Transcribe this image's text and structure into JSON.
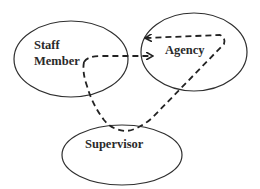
{
  "diagram": {
    "nodes": [
      {
        "id": "staff-member",
        "lines": [
          "Staff",
          "Member"
        ]
      },
      {
        "id": "agency",
        "lines": [
          "Agency"
        ]
      },
      {
        "id": "supervisor",
        "lines": [
          "Supervisor"
        ]
      }
    ],
    "edges": [
      {
        "from": "staff-member",
        "to": "agency",
        "style": "dashed",
        "route": "direct"
      },
      {
        "from": "staff-member",
        "to": "agency",
        "style": "dashed",
        "route": "via supervisor"
      }
    ],
    "colors": {
      "stroke": "#2f2f2f",
      "text": "#2a2a2a",
      "background": "#ffffff"
    }
  }
}
